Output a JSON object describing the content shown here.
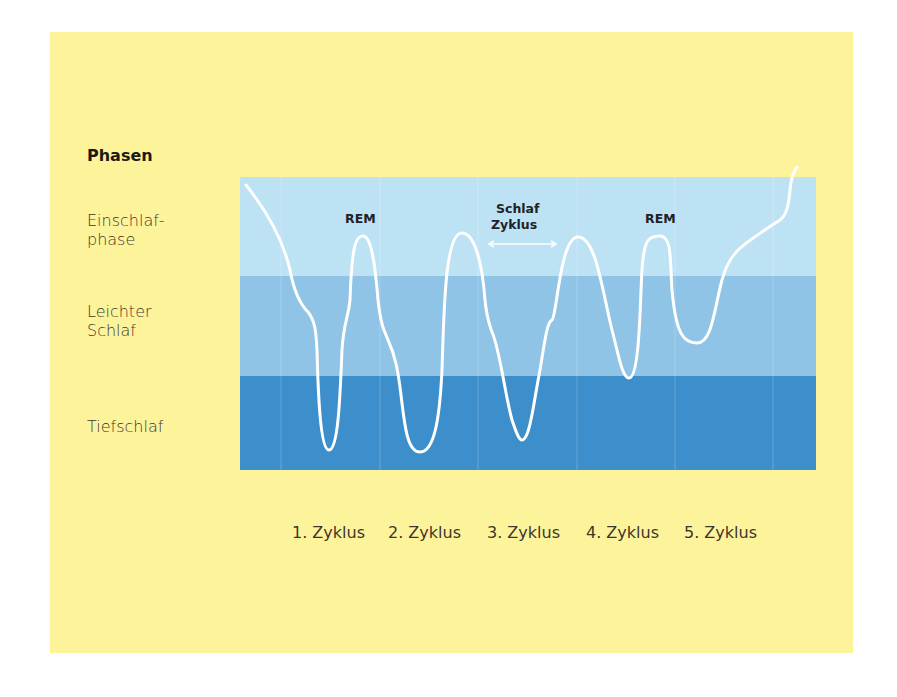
{
  "diagram": {
    "heading": "Phasen",
    "phases": [
      {
        "line1": "Einschlaf-",
        "line2": "phase"
      },
      {
        "line1": "Leichter",
        "line2": "Schlaf"
      },
      {
        "line1": "Tiefschlaf",
        "line2": ""
      }
    ],
    "cycles": [
      "1. Zyklus",
      "2. Zyklus",
      "3. Zyklus",
      "4. Zyklus",
      "5. Zyklus"
    ],
    "annotations": {
      "rem_1": "REM",
      "rem_2": "REM",
      "cycle_line1": "Schlaf",
      "cycle_line2": "Zyklus"
    },
    "colors": {
      "background_panel": "#fdf39b",
      "band_light": "#bde2f4",
      "band_mid": "#8fc4e6",
      "band_dark": "#3d8fcb",
      "curve": "#ffffff"
    }
  }
}
